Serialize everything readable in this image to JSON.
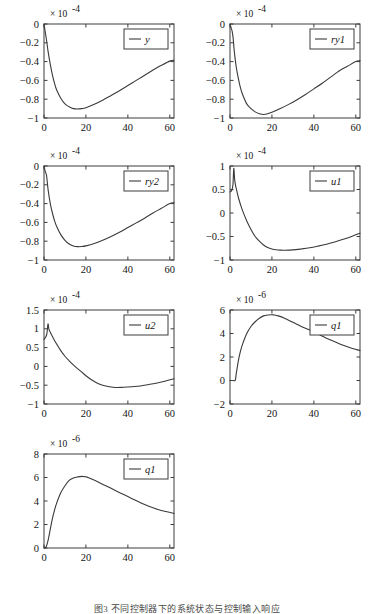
{
  "figure": {
    "caption": "图3 不同控制器下的系统状态与控制输入响应",
    "panel_count": 7,
    "line_color": "#3a3a3a",
    "axis_color": "#3c3c3c",
    "background": "#ffffff"
  },
  "chart_data": [
    {
      "id": "panel-y",
      "type": "line",
      "title": "",
      "xlabel": "",
      "ylabel": "",
      "exponent_label": "× 10",
      "exponent_power": "-4",
      "legend": [
        "y"
      ],
      "legend_position": "top-right",
      "grid": false,
      "xlim": [
        0,
        62
      ],
      "ylim": [
        -1,
        0
      ],
      "xticks": [
        0,
        20,
        40,
        60
      ],
      "xticklabels": [
        "0",
        "20",
        "40",
        "60"
      ],
      "yticks": [
        -1,
        -0.8,
        -0.6,
        -0.4,
        -0.2,
        0
      ],
      "yticklabels": [
        "−1",
        "−0.8",
        "−0.6",
        "−0.4",
        "−0.2",
        "0"
      ],
      "series": [
        {
          "name": "y",
          "x": [
            0,
            0.6,
            1.2,
            2,
            3,
            4,
            5,
            6,
            8,
            10,
            12,
            14,
            16,
            18,
            20,
            24,
            28,
            32,
            36,
            40,
            44,
            48,
            52,
            56,
            60,
            62
          ],
          "values": [
            0,
            -0.085,
            -0.17,
            -0.3,
            -0.43,
            -0.54,
            -0.63,
            -0.7,
            -0.79,
            -0.85,
            -0.88,
            -0.9,
            -0.905,
            -0.9,
            -0.89,
            -0.855,
            -0.81,
            -0.76,
            -0.71,
            -0.655,
            -0.6,
            -0.545,
            -0.49,
            -0.44,
            -0.395,
            -0.385
          ]
        }
      ]
    },
    {
      "id": "panel-ry1",
      "type": "line",
      "title": "",
      "xlabel": "",
      "ylabel": "",
      "exponent_label": "× 10",
      "exponent_power": "-4",
      "legend": [
        "ry1"
      ],
      "legend_position": "top-right",
      "grid": false,
      "xlim": [
        0,
        62
      ],
      "ylim": [
        -1,
        0
      ],
      "xticks": [
        0,
        20,
        40,
        60
      ],
      "xticklabels": [
        "0",
        "20",
        "40",
        "60"
      ],
      "yticks": [
        -1,
        -0.8,
        -0.6,
        -0.4,
        -0.2,
        0
      ],
      "yticklabels": [
        "−1",
        "−0.8",
        "−0.6",
        "−0.4",
        "−0.2",
        "0"
      ],
      "series": [
        {
          "name": "ry1",
          "x": [
            0,
            0.5,
            1,
            1.5,
            2,
            3,
            4,
            5,
            6,
            8,
            10,
            12,
            14,
            16,
            18,
            20,
            24,
            28,
            32,
            36,
            40,
            44,
            48,
            52,
            56,
            60,
            62
          ],
          "values": [
            0,
            -0.04,
            -0.075,
            -0.15,
            -0.28,
            -0.46,
            -0.58,
            -0.68,
            -0.75,
            -0.85,
            -0.9,
            -0.935,
            -0.955,
            -0.962,
            -0.955,
            -0.94,
            -0.9,
            -0.855,
            -0.805,
            -0.75,
            -0.69,
            -0.63,
            -0.565,
            -0.5,
            -0.45,
            -0.4,
            -0.39
          ]
        }
      ]
    },
    {
      "id": "panel-ry2",
      "type": "line",
      "title": "",
      "xlabel": "",
      "ylabel": "",
      "exponent_label": "× 10",
      "exponent_power": "-4",
      "legend": [
        "ry2"
      ],
      "legend_position": "top-right",
      "grid": false,
      "xlim": [
        0,
        62
      ],
      "ylim": [
        -1,
        0
      ],
      "xticks": [
        0,
        20,
        40,
        60
      ],
      "xticklabels": [
        "0",
        "20",
        "40",
        "60"
      ],
      "yticks": [
        -1,
        -0.8,
        -0.6,
        -0.4,
        -0.2,
        0
      ],
      "yticklabels": [
        "−1",
        "−0.8",
        "−0.6",
        "−0.4",
        "−0.2",
        "0"
      ],
      "series": [
        {
          "name": "ry2",
          "x": [
            0,
            0.6,
            1.2,
            2,
            3,
            4,
            5,
            6,
            8,
            10,
            12,
            14,
            16,
            18,
            20,
            24,
            28,
            32,
            36,
            40,
            44,
            48,
            52,
            56,
            60,
            62
          ],
          "values": [
            0,
            -0.06,
            -0.1,
            -0.26,
            -0.4,
            -0.5,
            -0.58,
            -0.64,
            -0.73,
            -0.79,
            -0.83,
            -0.85,
            -0.858,
            -0.857,
            -0.85,
            -0.825,
            -0.79,
            -0.75,
            -0.705,
            -0.655,
            -0.605,
            -0.555,
            -0.5,
            -0.45,
            -0.4,
            -0.39
          ]
        }
      ]
    },
    {
      "id": "panel-u1",
      "type": "line",
      "title": "",
      "xlabel": "",
      "ylabel": "",
      "exponent_label": "× 10",
      "exponent_power": "-4",
      "legend": [
        "u1"
      ],
      "legend_position": "top-right",
      "grid": false,
      "xlim": [
        0,
        62
      ],
      "ylim": [
        -1,
        1
      ],
      "xticks": [
        0,
        20,
        40,
        60
      ],
      "xticklabels": [
        "0",
        "20",
        "40",
        "60"
      ],
      "yticks": [
        -1,
        -0.5,
        0,
        0.5,
        1
      ],
      "yticklabels": [
        "−1",
        "−0.5",
        "0",
        "0.5",
        "1"
      ],
      "series": [
        {
          "name": "u1",
          "x": [
            0,
            0.8,
            1.4,
            1.8,
            2.2,
            2.6,
            3,
            4,
            5,
            6,
            8,
            10,
            12,
            14,
            16,
            18,
            20,
            22,
            24,
            26,
            30,
            34,
            38,
            42,
            46,
            50,
            54,
            58,
            62
          ],
          "values": [
            0.45,
            0.48,
            0.6,
            0.95,
            0.72,
            0.6,
            0.52,
            0.33,
            0.18,
            0.05,
            -0.17,
            -0.35,
            -0.5,
            -0.6,
            -0.68,
            -0.735,
            -0.765,
            -0.782,
            -0.79,
            -0.792,
            -0.785,
            -0.765,
            -0.74,
            -0.705,
            -0.665,
            -0.615,
            -0.56,
            -0.5,
            -0.43
          ]
        }
      ]
    },
    {
      "id": "panel-u2",
      "type": "line",
      "title": "",
      "xlabel": "",
      "ylabel": "",
      "exponent_label": "× 10",
      "exponent_power": "-4",
      "legend": [
        "u2"
      ],
      "legend_position": "top-right",
      "grid": false,
      "xlim": [
        0,
        62
      ],
      "ylim": [
        -1,
        1.5
      ],
      "xticks": [
        0,
        20,
        40,
        60
      ],
      "xticklabels": [
        "0",
        "20",
        "40",
        "60"
      ],
      "yticks": [
        -1,
        -0.5,
        0,
        0.5,
        1,
        1.5
      ],
      "yticklabels": [
        "−1",
        "−0.5",
        "0",
        "0.5",
        "1",
        "1.5"
      ],
      "series": [
        {
          "name": "u2",
          "x": [
            0,
            0.8,
            1.4,
            1.9,
            2.3,
            2.8,
            3.5,
            4.5,
            6,
            8,
            10,
            12,
            14,
            16,
            18,
            20,
            23,
            26,
            30,
            34,
            38,
            42,
            46,
            50,
            54,
            58,
            62
          ],
          "values": [
            0.72,
            0.78,
            0.88,
            1.13,
            1.0,
            0.93,
            0.85,
            0.74,
            0.6,
            0.42,
            0.27,
            0.15,
            0.04,
            -0.06,
            -0.15,
            -0.25,
            -0.37,
            -0.46,
            -0.53,
            -0.56,
            -0.555,
            -0.54,
            -0.52,
            -0.48,
            -0.44,
            -0.39,
            -0.33
          ]
        }
      ]
    },
    {
      "id": "panel-q1-upper",
      "type": "line",
      "title": "",
      "xlabel": "",
      "ylabel": "",
      "exponent_label": "× 10",
      "exponent_power": "-6",
      "legend": [
        "q1"
      ],
      "legend_position": "top-right",
      "grid": false,
      "xlim": [
        0,
        62
      ],
      "ylim": [
        -2,
        6
      ],
      "xticks": [
        0,
        20,
        40,
        60
      ],
      "xticklabels": [
        "0",
        "20",
        "40",
        "60"
      ],
      "yticks": [
        -2,
        0,
        2,
        4,
        6
      ],
      "yticklabels": [
        "−2",
        "0",
        "2",
        "4",
        "6"
      ],
      "series": [
        {
          "name": "q1",
          "x": [
            0,
            1.5,
            2.5,
            3,
            4,
            5,
            6,
            8,
            10,
            12,
            14,
            16,
            18,
            20,
            21,
            23,
            26,
            30,
            34,
            38,
            42,
            46,
            50,
            54,
            58,
            62
          ],
          "values": [
            0,
            0,
            0.02,
            0.6,
            1.7,
            2.5,
            3.1,
            4.0,
            4.6,
            5.0,
            5.3,
            5.5,
            5.58,
            5.6,
            5.58,
            5.5,
            5.3,
            4.95,
            4.6,
            4.3,
            3.95,
            3.6,
            3.3,
            3.0,
            2.75,
            2.55
          ]
        }
      ]
    },
    {
      "id": "panel-q1-lower",
      "type": "line",
      "title": "",
      "xlabel": "",
      "ylabel": "",
      "exponent_label": "× 10",
      "exponent_power": "-6",
      "legend": [
        "q1"
      ],
      "legend_position": "top-right",
      "grid": false,
      "xlim": [
        0,
        62
      ],
      "ylim": [
        0,
        8
      ],
      "xticks": [
        0,
        20,
        40,
        60
      ],
      "xticklabels": [
        "0",
        "20",
        "40",
        "60"
      ],
      "yticks": [
        0,
        2,
        4,
        6,
        8
      ],
      "yticklabels": [
        "0",
        "2",
        "4",
        "6",
        "8"
      ],
      "series": [
        {
          "name": "q1",
          "x": [
            0,
            1,
            2,
            3,
            4,
            5,
            6,
            8,
            10,
            12,
            14,
            16,
            18,
            20,
            21,
            23,
            26,
            30,
            34,
            38,
            42,
            46,
            50,
            54,
            58,
            62
          ],
          "values": [
            0,
            0.1,
            0.7,
            1.6,
            2.5,
            3.2,
            3.8,
            4.7,
            5.3,
            5.75,
            5.95,
            6.05,
            6.1,
            6.05,
            6.0,
            5.85,
            5.6,
            5.25,
            4.9,
            4.55,
            4.2,
            3.85,
            3.55,
            3.3,
            3.1,
            2.95
          ]
        }
      ]
    }
  ]
}
